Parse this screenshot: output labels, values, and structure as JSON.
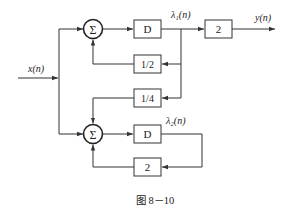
{
  "figure": {
    "caption": "图 8－10",
    "type": "block-diagram"
  },
  "signals": {
    "input": "x(n)",
    "output": "y(n)",
    "state1": "λ₁(n)",
    "state2": "λ₂(n)"
  },
  "blocks": {
    "sum_top": "Σ",
    "sum_bottom": "Σ",
    "delay_top": "D",
    "gain_output": "2",
    "gain_half": "1/2",
    "gain_quarter": "1/4",
    "delay_bottom": "D",
    "gain_bottom": "2"
  },
  "colors": {
    "line": "#333333",
    "text": "#222222",
    "background": "#ffffff"
  }
}
